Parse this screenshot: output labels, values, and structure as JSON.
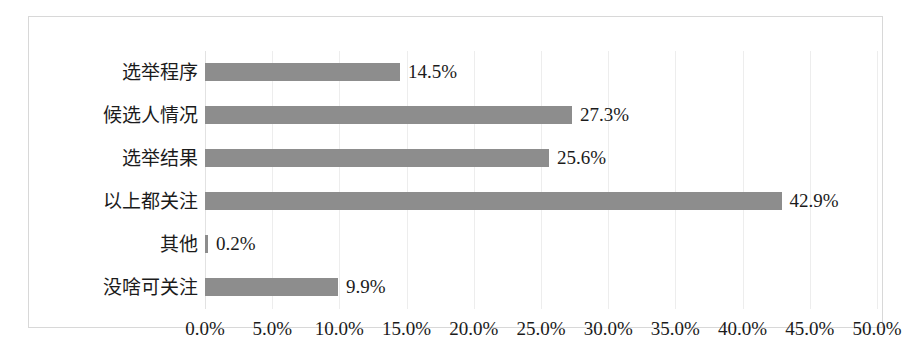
{
  "chart_data": {
    "type": "bar",
    "orientation": "horizontal",
    "title": "",
    "subtitle": "",
    "xlabel": "",
    "ylabel": "",
    "categories": [
      "选举程序",
      "候选人情况",
      "选举结果",
      "以上都关注",
      "其他",
      "没啥可关注"
    ],
    "values": [
      14.5,
      27.3,
      25.6,
      42.9,
      0.2,
      9.9
    ],
    "data_labels": [
      "14.5%",
      "27.3%",
      "25.6%",
      "42.9%",
      "0.2%",
      "9.9%"
    ],
    "xlim": [
      0,
      50
    ],
    "xticks": [
      0,
      5,
      10,
      15,
      20,
      25,
      30,
      35,
      40,
      45,
      50
    ],
    "xtick_labels": [
      "0.0%",
      "5.0%",
      "10.0%",
      "15.0%",
      "20.0%",
      "25.0%",
      "30.0%",
      "35.0%",
      "40.0%",
      "45.0%",
      "50.0%"
    ],
    "grid": true,
    "grid_axis": "x",
    "legend": false,
    "legend_position": "none",
    "bar_color": "#8d8d8d",
    "grid_color": "#ededed",
    "frame_color": "#d8d8d8",
    "text_color": "#1b1b1b",
    "background_color": "#ffffff"
  }
}
